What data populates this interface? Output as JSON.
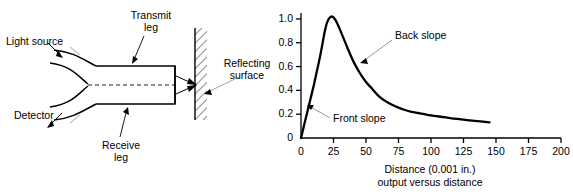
{
  "figure": {
    "left_diagram": {
      "name": "reflective-fiber-optic-probe-diagram",
      "labels": {
        "light_source": "Light source",
        "detector": "Detector",
        "transmit_leg_line1": "Transmit",
        "transmit_leg_line2": "leg",
        "receive_leg_line1": "Receive",
        "receive_leg_line2": "leg",
        "reflecting_surface_line1": "Reflecting",
        "reflecting_surface_line2": "surface"
      }
    },
    "right_chart": {
      "name": "output-versus-distance-plot"
    }
  },
  "chart_data": {
    "type": "line",
    "title": "",
    "xlabel_line1": "Distance (0.001 in.)",
    "xlabel_line2": "output versus distance",
    "ylabel": "",
    "xlim": [
      0,
      200
    ],
    "ylim": [
      0,
      1.05
    ],
    "grid": false,
    "legend": "none",
    "xticks": [
      0,
      25,
      50,
      75,
      100,
      125,
      150,
      175,
      200
    ],
    "xtick_labels": [
      "0",
      "25",
      "50",
      "75",
      "100",
      "125",
      "150",
      "175",
      "200"
    ],
    "yticks": [
      0,
      0.2,
      0.4,
      0.6,
      0.8,
      1.0
    ],
    "ytick_labels": [
      "0",
      "0.2",
      "0.4",
      "0.6",
      "0.8",
      "1.0"
    ],
    "series": [
      {
        "name": "output",
        "x": [
          0,
          2,
          4,
          6,
          8,
          10,
          12,
          14,
          16,
          18,
          20,
          22,
          24,
          26,
          28,
          30,
          33,
          36,
          40,
          45,
          50,
          55,
          60,
          65,
          70,
          75,
          80,
          85,
          90,
          95,
          100,
          110,
          120,
          130,
          140,
          145
        ],
        "y": [
          0.0,
          0.09,
          0.18,
          0.27,
          0.36,
          0.45,
          0.55,
          0.65,
          0.76,
          0.88,
          0.97,
          1.01,
          1.02,
          1.0,
          0.96,
          0.91,
          0.83,
          0.75,
          0.65,
          0.55,
          0.47,
          0.41,
          0.35,
          0.31,
          0.28,
          0.255,
          0.235,
          0.22,
          0.21,
          0.2,
          0.19,
          0.175,
          0.16,
          0.148,
          0.137,
          0.132
        ]
      }
    ],
    "annotations": [
      {
        "name": "front-slope-annotation",
        "text": "Front slope",
        "points_to": {
          "x": 6,
          "y": 0.27
        }
      },
      {
        "name": "back-slope-annotation",
        "text": "Back slope",
        "points_to": {
          "x": 44,
          "y": 0.6
        }
      }
    ]
  }
}
